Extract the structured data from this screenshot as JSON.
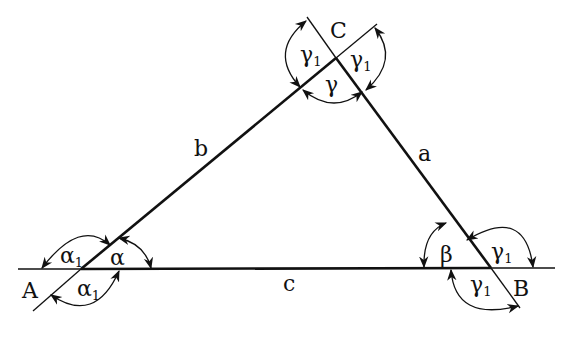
{
  "diagram": {
    "type": "triangle-angles",
    "vertices": {
      "A": {
        "label": "A"
      },
      "B": {
        "label": "B"
      },
      "C": {
        "label": "C"
      }
    },
    "sides": {
      "a": {
        "label": "a",
        "between": [
          "B",
          "C"
        ]
      },
      "b": {
        "label": "b",
        "between": [
          "A",
          "C"
        ]
      },
      "c": {
        "label": "c",
        "between": [
          "A",
          "B"
        ]
      }
    },
    "interior_angles": {
      "alpha": {
        "symbol": "α",
        "vertex": "A"
      },
      "beta": {
        "symbol": "β",
        "vertex": "B"
      },
      "gamma": {
        "symbol": "γ",
        "vertex": "C"
      }
    },
    "exterior_angles": {
      "at_A": [
        {
          "symbol": "α",
          "subscript": "1",
          "position": "upper-left"
        },
        {
          "symbol": "α",
          "subscript": "1",
          "position": "lower-right"
        }
      ],
      "at_B": [
        {
          "symbol": "γ",
          "subscript": "1",
          "position": "upper-right"
        },
        {
          "symbol": "γ",
          "subscript": "1",
          "position": "lower-left"
        }
      ],
      "at_C": [
        {
          "symbol": "γ",
          "subscript": "1",
          "position": "left"
        },
        {
          "symbol": "γ",
          "subscript": "1",
          "position": "right"
        }
      ]
    },
    "colors": {
      "line": "#111111",
      "background": "#ffffff"
    }
  }
}
